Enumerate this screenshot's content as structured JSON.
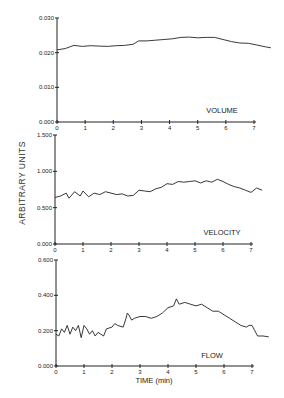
{
  "chart_data": [
    {
      "type": "line",
      "panel_label": "VOLUME",
      "xlabel": "",
      "ylabel": "ARBITRARY UNITS",
      "xlim": [
        0,
        7.5
      ],
      "ylim": [
        0,
        0.03
      ],
      "x_ticks": [
        0,
        1,
        2,
        3,
        4,
        5,
        6,
        7
      ],
      "y_ticks": [
        "0.000",
        "0.010",
        "0.020",
        "0.030"
      ],
      "y_tick_values": [
        0,
        0.01,
        0.02,
        0.03
      ],
      "grid": false,
      "x": [
        0,
        0.3,
        0.6,
        0.9,
        1.2,
        1.5,
        1.8,
        2.1,
        2.4,
        2.7,
        2.9,
        3.2,
        3.5,
        3.8,
        4.1,
        4.4,
        4.7,
        5.0,
        5.3,
        5.6,
        5.9,
        6.2,
        6.5,
        6.8,
        7.1,
        7.4,
        7.6
      ],
      "values": [
        0.0208,
        0.0212,
        0.0221,
        0.0218,
        0.022,
        0.0219,
        0.0218,
        0.022,
        0.0221,
        0.0224,
        0.0234,
        0.0234,
        0.0236,
        0.0238,
        0.024,
        0.0244,
        0.0245,
        0.0243,
        0.0244,
        0.0244,
        0.0238,
        0.0232,
        0.0228,
        0.0227,
        0.0222,
        0.0217,
        0.0214
      ]
    },
    {
      "type": "line",
      "panel_label": "VELOCITY",
      "xlabel": "",
      "ylabel": "ARBITRARY UNITS",
      "xlim": [
        0,
        7.5
      ],
      "ylim": [
        0,
        1.5
      ],
      "x_ticks": [
        0,
        1,
        2,
        3,
        4,
        5,
        6,
        7
      ],
      "y_ticks": [
        "0.000",
        "0.500",
        "1.000",
        "1.500"
      ],
      "y_tick_values": [
        0,
        0.5,
        1.0,
        1.5
      ],
      "grid": false,
      "x": [
        0,
        0.2,
        0.4,
        0.5,
        0.7,
        0.9,
        1.0,
        1.2,
        1.4,
        1.6,
        1.8,
        2.0,
        2.2,
        2.4,
        2.6,
        2.8,
        3.0,
        3.2,
        3.4,
        3.6,
        3.8,
        4.0,
        4.2,
        4.4,
        4.6,
        4.8,
        5.0,
        5.2,
        5.4,
        5.6,
        5.8,
        6.0,
        6.2,
        6.4,
        6.6,
        6.8,
        7.0,
        7.2,
        7.4
      ],
      "values": [
        0.64,
        0.66,
        0.7,
        0.63,
        0.72,
        0.66,
        0.73,
        0.65,
        0.7,
        0.68,
        0.72,
        0.7,
        0.68,
        0.69,
        0.66,
        0.67,
        0.74,
        0.73,
        0.72,
        0.76,
        0.78,
        0.83,
        0.82,
        0.86,
        0.85,
        0.86,
        0.87,
        0.84,
        0.87,
        0.85,
        0.89,
        0.86,
        0.82,
        0.79,
        0.77,
        0.74,
        0.71,
        0.77,
        0.74
      ]
    },
    {
      "type": "line",
      "panel_label": "FLOW",
      "xlabel": "TIME (min)",
      "ylabel": "ARBITRARY UNITS",
      "xlim": [
        0,
        7.5
      ],
      "ylim": [
        0,
        0.6
      ],
      "x_ticks": [
        0,
        1,
        2,
        3,
        4,
        5,
        6,
        7
      ],
      "y_ticks": [
        "0.000",
        "0.200",
        "0.400",
        "0.600"
      ],
      "y_tick_values": [
        0,
        0.2,
        0.4,
        0.6
      ],
      "grid": false,
      "x": [
        0,
        0.1,
        0.2,
        0.3,
        0.4,
        0.5,
        0.6,
        0.7,
        0.8,
        0.9,
        1.0,
        1.1,
        1.2,
        1.3,
        1.4,
        1.5,
        1.6,
        1.7,
        1.8,
        2.0,
        2.1,
        2.2,
        2.4,
        2.5,
        2.55,
        2.6,
        2.7,
        2.8,
        3.0,
        3.2,
        3.4,
        3.6,
        3.8,
        4.0,
        4.2,
        4.3,
        4.4,
        4.6,
        4.8,
        5.0,
        5.2,
        5.4,
        5.6,
        5.8,
        6.0,
        6.2,
        6.4,
        6.6,
        6.8,
        6.9,
        7.0,
        7.1,
        7.2,
        7.4,
        7.6
      ],
      "values": [
        0.18,
        0.17,
        0.21,
        0.19,
        0.23,
        0.18,
        0.22,
        0.2,
        0.23,
        0.16,
        0.23,
        0.21,
        0.18,
        0.2,
        0.17,
        0.19,
        0.18,
        0.17,
        0.21,
        0.22,
        0.24,
        0.23,
        0.22,
        0.27,
        0.3,
        0.29,
        0.26,
        0.27,
        0.28,
        0.28,
        0.27,
        0.28,
        0.3,
        0.33,
        0.34,
        0.38,
        0.35,
        0.36,
        0.35,
        0.34,
        0.35,
        0.33,
        0.31,
        0.31,
        0.29,
        0.27,
        0.25,
        0.23,
        0.22,
        0.23,
        0.23,
        0.2,
        0.17,
        0.17,
        0.165
      ]
    }
  ],
  "labels": {
    "y_axis_shared": "ARBITRARY UNITS",
    "x_axis": "TIME (min)",
    "volume": "VOLUME",
    "velocity": "VELOCITY",
    "flow": "FLOW"
  }
}
